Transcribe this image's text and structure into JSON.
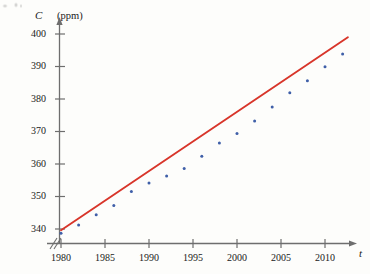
{
  "chart_data": {
    "type": "scatter",
    "title": "",
    "subtitle": "",
    "xlabel": "t",
    "ylabel": "C",
    "yunit": "(ppm)",
    "xlim": [
      1979,
      2013
    ],
    "ylim": [
      338,
      402
    ],
    "grid": false,
    "legend": "none",
    "axis_break_x": true,
    "xticks": [
      1980,
      1985,
      1990,
      1995,
      2000,
      2005,
      2010
    ],
    "yticks": [
      340,
      350,
      360,
      370,
      380,
      390,
      400
    ],
    "point_color": "#3f5fa8",
    "line_color": "#d8352a",
    "axis_color": "#6e6e6e",
    "series": [
      {
        "name": "CO2 concentration",
        "type": "scatter",
        "marker": "dot",
        "x": [
          1980,
          1982,
          1984,
          1986,
          1988,
          1990,
          1992,
          1994,
          1996,
          1998,
          2000,
          2002,
          2004,
          2006,
          2008,
          2010,
          2012
        ],
        "values": [
          338.7,
          341.2,
          344.4,
          347.2,
          351.5,
          354.2,
          356.3,
          358.6,
          362.4,
          366.5,
          369.4,
          373.2,
          377.5,
          381.9,
          385.6,
          389.9,
          393.8
        ]
      },
      {
        "name": "Linear regression line",
        "type": "line",
        "x": [
          1980,
          2012.6
        ],
        "values": [
          339.6,
          399.0
        ]
      }
    ],
    "annotations": []
  }
}
